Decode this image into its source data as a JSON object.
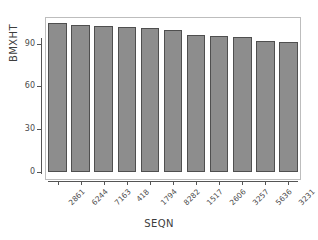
{
  "chart_data": {
    "type": "bar",
    "title": "",
    "xlabel": "SEQN",
    "ylabel": "BMXHT",
    "categories": [
      "2861",
      "6244",
      "7163",
      "418",
      "1794",
      "8282",
      "1517",
      "2606",
      "3257",
      "5636",
      "3231"
    ],
    "values": [
      104.4,
      103.0,
      102.3,
      102.0,
      101.3,
      99.6,
      95.8,
      95.5,
      94.8,
      92.0,
      91.3
    ],
    "ylim": [
      0,
      108
    ],
    "yticks": [
      0,
      30,
      60,
      90
    ],
    "ytick_labels": [
      "0",
      "30",
      "60",
      "90"
    ],
    "grid": false,
    "legend": false,
    "bar_color": "#8d8d8d",
    "bar_border_color": "#4f4f4f",
    "axis_color": "#555555",
    "frame_color": "#bdbdbd",
    "background": "#ffffff"
  }
}
